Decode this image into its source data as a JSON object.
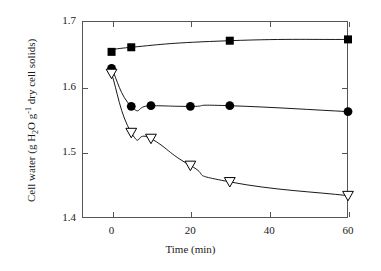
{
  "chart_data": {
    "type": "line",
    "title": "",
    "xlabel": "Time (min)",
    "ylabel": "Cell water (g H2O g-1 dry cell solids)",
    "ylabel_parts": {
      "pre": "Cell water (g H",
      "sub1": "2",
      "mid": "O g",
      "sup1": "-1",
      "post": " dry cell solids)"
    },
    "xlim": [
      -7.5,
      60.0
    ],
    "ylim": [
      1.4,
      1.7
    ],
    "xticks": [
      0,
      20,
      40,
      60
    ],
    "xtick_labels": [
      "0",
      "20",
      "40",
      "60"
    ],
    "yticks": [
      1.4,
      1.5,
      1.6,
      1.7
    ],
    "ytick_labels": [
      "1.4",
      "1.5",
      "1.6",
      "1.7"
    ],
    "grid": false,
    "legend": "none",
    "series": [
      {
        "name": "filled-square-series",
        "marker": "filled-square",
        "color": "#000000",
        "x": [
          0,
          5,
          30,
          60
        ],
        "values": [
          1.653,
          1.66,
          1.67,
          1.672
        ]
      },
      {
        "name": "filled-circle-series",
        "marker": "filled-circle",
        "color": "#000000",
        "x": [
          0,
          5,
          10,
          20,
          30,
          60
        ],
        "values": [
          1.628,
          1.57,
          1.571,
          1.57,
          1.571,
          1.562
        ]
      },
      {
        "name": "open-triangle-down-series",
        "marker": "open-triangle-down",
        "color": "#000000",
        "x": [
          0,
          5,
          10,
          20,
          30,
          60
        ],
        "values": [
          1.62,
          1.53,
          1.521,
          1.48,
          1.455,
          1.434
        ]
      }
    ]
  }
}
